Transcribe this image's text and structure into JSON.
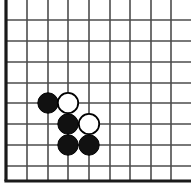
{
  "board": {
    "title": "Go board corner position",
    "type": "go-board",
    "width": 191,
    "height": 188,
    "background_color": "#ffffff",
    "line_color": "#4d4d4d",
    "border_color": "#1a1a1a",
    "line_width": 1.6,
    "border_width": 3.2,
    "grid": {
      "vertical_lines_x": [
        6,
        27,
        48,
        68,
        89,
        110,
        130,
        151,
        171
      ],
      "horizontal_lines_y": [
        20,
        41,
        62,
        83,
        103,
        124,
        145,
        166,
        181
      ],
      "columns": 9,
      "rows": 9,
      "spacing": 20.7,
      "top_open": true,
      "right_open": true,
      "left_edge_is_border": true,
      "bottom_edge_is_border": true
    },
    "stone_radius": 10.2,
    "stone_colors": {
      "black_fill": "#111111",
      "black_stroke": "#000000",
      "white_fill": "#ffffff",
      "white_stroke": "#000000"
    },
    "stones": [
      {
        "id": "stone-1",
        "color": "black",
        "cx": 48,
        "cy": 103,
        "label": "black-stone-c5"
      },
      {
        "id": "stone-2",
        "color": "white",
        "cx": 68,
        "cy": 103,
        "label": "white-stone-d5"
      },
      {
        "id": "stone-3",
        "color": "black",
        "cx": 68,
        "cy": 124,
        "label": "black-stone-d6"
      },
      {
        "id": "stone-4",
        "color": "white",
        "cx": 89,
        "cy": 124,
        "label": "white-stone-e6"
      },
      {
        "id": "stone-5",
        "color": "black",
        "cx": 68,
        "cy": 145,
        "label": "black-stone-d7"
      },
      {
        "id": "stone-6",
        "color": "black",
        "cx": 89,
        "cy": 145,
        "label": "black-stone-e7"
      }
    ]
  }
}
